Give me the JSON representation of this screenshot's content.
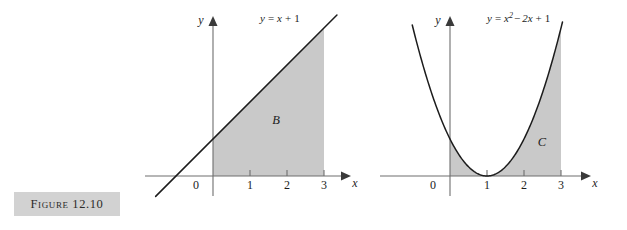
{
  "figure": {
    "caption": "Figure 12.10",
    "background_color": "#ffffff",
    "caption_box_color": "#d2d2d2",
    "shade_color": "#c9c9c9",
    "curve_color": "#1c1c1c",
    "axis_color": "#6e6e6e"
  },
  "chart_data": [
    {
      "type": "area",
      "id": "left-panel",
      "title": "",
      "equation_label": "y = x + 1",
      "equation_parts": {
        "lhs": "y",
        "eq": "=",
        "term1": "x",
        "plus": "+",
        "term2": "1"
      },
      "function": "y = x + 1",
      "region_label": "B",
      "region_description": "Area under y = x + 1 from x = 0 to x = 3",
      "xlabel": "x",
      "ylabel": "y",
      "xticks": [
        0,
        1,
        2,
        3
      ],
      "xtick_labels": [
        "0",
        "1",
        "2",
        "3"
      ],
      "yticks": [],
      "ytick_labels": [],
      "xlim": [
        -1.5,
        3.7
      ],
      "ylim": [
        -0.6,
        4.4
      ],
      "grid": false,
      "legend": "none",
      "shaded_x_range": [
        0,
        3
      ],
      "x": [
        -1.5,
        0,
        1,
        2,
        3,
        3.3
      ],
      "y": [
        -0.5,
        1,
        2,
        3,
        4,
        4.3
      ]
    },
    {
      "type": "area",
      "id": "right-panel",
      "title": "",
      "equation_label": "y = x² − 2x + 1",
      "equation_parts": {
        "lhs": "y",
        "eq": "=",
        "term1": "x",
        "exp": "2",
        "minus": "−",
        "term2": "2x",
        "plus": "+",
        "term3": "1"
      },
      "function": "y = x^2 - 2x + 1",
      "region_label": "C",
      "region_description": "Area under y = (x − 1)² from x = 0 to x = 3",
      "xlabel": "x",
      "ylabel": "y",
      "xticks": [
        0,
        1,
        2,
        3
      ],
      "xtick_labels": [
        "0",
        "1",
        "2",
        "3"
      ],
      "yticks": [],
      "ytick_labels": [],
      "xlim": [
        -1.1,
        3.7
      ],
      "ylim": [
        -0.6,
        4.4
      ],
      "grid": false,
      "legend": "none",
      "vertex": [
        1,
        0
      ],
      "shaded_x_range": [
        0,
        3
      ],
      "x": [
        -1.0,
        -0.5,
        0,
        0.5,
        1,
        1.5,
        2,
        2.5,
        3,
        3.1
      ],
      "y": [
        4.0,
        2.25,
        1,
        0.25,
        0,
        0.25,
        1,
        2.25,
        4,
        4.41
      ]
    }
  ]
}
